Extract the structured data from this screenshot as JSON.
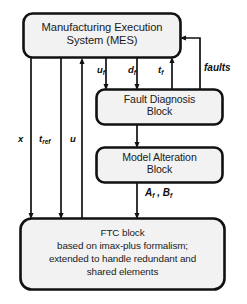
{
  "figure": {
    "type": "block-diagram",
    "background_color": "#ffffff",
    "block_fill": "#f2f2f2",
    "block_stroke": "#111111",
    "line_color": "#111111"
  },
  "blocks": [
    {
      "id": "mes",
      "name": "manufacturing-execution-system-block",
      "text": "Manufacturing Execution\nSystem (MES)",
      "x": 23,
      "y": 13,
      "w": 158,
      "h": 45
    },
    {
      "id": "fdb",
      "name": "fault-diagnosis-block",
      "text": "Fault Diagnosis\nBlock",
      "x": 96,
      "y": 89,
      "w": 127,
      "h": 36
    },
    {
      "id": "mab",
      "name": "model-alteration-block",
      "text": "Model Alteration\nBlock",
      "x": 96,
      "y": 147,
      "w": 127,
      "h": 36
    },
    {
      "id": "ftc",
      "name": "ftc-block",
      "text": "FTC block\nbased on imax-plus formalism;\nextended to handle redundant and\nshared elements",
      "x": 20,
      "y": 218,
      "w": 205,
      "h": 72
    }
  ],
  "signal_labels": [
    {
      "id": "uf",
      "name": "signal-label-uf",
      "base": "u",
      "sub": "f",
      "x": 97,
      "y": 66
    },
    {
      "id": "df",
      "name": "signal-label-df",
      "base": "d",
      "sub": "f",
      "x": 128,
      "y": 66
    },
    {
      "id": "tf",
      "name": "signal-label-tf",
      "base": "t",
      "sub": "f",
      "x": 157,
      "y": 66
    },
    {
      "id": "faults",
      "name": "signal-label-faults",
      "base": "faults",
      "sub": "",
      "x": 204,
      "y": 62
    },
    {
      "id": "x",
      "name": "signal-label-x",
      "base": "x",
      "sub": "",
      "x": 18,
      "y": 136
    },
    {
      "id": "tref",
      "name": "signal-label-tref",
      "base": "t",
      "sub": "ref",
      "x": 39,
      "y": 136
    },
    {
      "id": "u",
      "name": "signal-label-u",
      "base": "u",
      "sub": "",
      "x": 70,
      "y": 136
    },
    {
      "id": "afbf",
      "name": "signal-label-af-bf",
      "base": "A",
      "sub": "f",
      "x": 145,
      "y": 188,
      "suffix": " , B",
      "suffix_sub": "f"
    }
  ],
  "connections": [
    {
      "name": "arrow-mes-to-fdb-uf",
      "from": "mes",
      "to": "fdb",
      "signal": "u_f",
      "direction": "down"
    },
    {
      "name": "arrow-mes-to-fdb-df",
      "from": "mes",
      "to": "fdb",
      "signal": "d_f",
      "direction": "down"
    },
    {
      "name": "arrow-fdb-to-mes-tf",
      "from": "fdb",
      "to": "mes",
      "signal": "t_f",
      "direction": "up"
    },
    {
      "name": "arrow-fdb-to-mes-faults",
      "from": "fdb",
      "to": "mes",
      "signal": "faults",
      "direction": "up-left"
    },
    {
      "name": "arrow-fdb-to-mab",
      "from": "fdb",
      "to": "mab",
      "signal": "",
      "direction": "down"
    },
    {
      "name": "arrow-mab-to-ftc-af-bf",
      "from": "mab",
      "to": "ftc",
      "signal": "A_f , B_f",
      "direction": "down"
    },
    {
      "name": "arrow-mes-to-ftc-x",
      "from": "mes",
      "to": "ftc",
      "signal": "x",
      "direction": "down"
    },
    {
      "name": "arrow-mes-to-ftc-tref",
      "from": "mes",
      "to": "ftc",
      "signal": "t_ref",
      "direction": "down"
    },
    {
      "name": "arrow-ftc-to-mes-u",
      "from": "ftc",
      "to": "mes",
      "signal": "u",
      "direction": "up"
    }
  ]
}
